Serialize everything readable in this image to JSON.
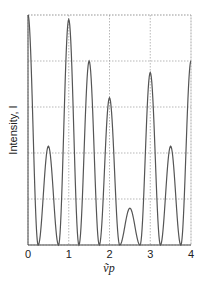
{
  "chart_data": {
    "type": "line",
    "title": "",
    "xlabel": "ṽp",
    "ylabel": "Intensity, I",
    "xlim": [
      0,
      4
    ],
    "ylim": [
      0,
      1
    ],
    "x_ticks": [
      "0",
      "1",
      "2",
      "3",
      "4"
    ],
    "grid": {
      "vertical": [
        1,
        2,
        3,
        4
      ],
      "horizontal": [
        0.2,
        0.4,
        0.6,
        0.8,
        1.0
      ],
      "style": "dotted"
    },
    "series": [
      {
        "name": "Intensity",
        "peaks": [
          {
            "x": 0.0,
            "y": 1.0
          },
          {
            "x": 0.5,
            "y": 0.43
          },
          {
            "x": 1.0,
            "y": 0.98
          },
          {
            "x": 1.5,
            "y": 0.8
          },
          {
            "x": 2.0,
            "y": 0.64
          },
          {
            "x": 2.5,
            "y": 0.16
          },
          {
            "x": 3.0,
            "y": 0.75
          },
          {
            "x": 3.5,
            "y": 0.43
          },
          {
            "x": 4.0,
            "y": 0.8
          }
        ],
        "minima_y": 0.0
      }
    ],
    "line_color": "#555555",
    "grid_color": "#888888"
  },
  "axes": {
    "x_label": "ṽp",
    "y_label": "Intensity, I"
  }
}
